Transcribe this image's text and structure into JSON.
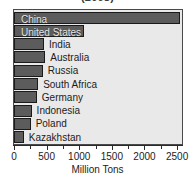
{
  "chart_data": {
    "type": "bar",
    "orientation": "horizontal",
    "title": "(2008)",
    "xlabel": "Million Tons",
    "ylabel": "",
    "xlim": [
      0,
      2575
    ],
    "grid": false,
    "legend": null,
    "bar_color": "#5c5c5c",
    "plot_background": "#e9e9e9",
    "categories": [
      "China",
      "United States",
      "India",
      "Australia",
      "Russia",
      "South Africa",
      "Germany",
      "Indonesia",
      "Poland",
      "Kazakhstan"
    ],
    "values": [
      2550,
      1070,
      460,
      480,
      440,
      370,
      350,
      270,
      255,
      150
    ],
    "label_placement": [
      "inside",
      "inside",
      "outside",
      "outside",
      "outside",
      "outside",
      "outside",
      "outside",
      "outside",
      "outside"
    ],
    "ticks": [
      {
        "value": 0,
        "label": "0"
      },
      {
        "value": 500,
        "label": "500"
      },
      {
        "value": 1000,
        "label": "1000"
      },
      {
        "value": 1500,
        "label": "1500"
      },
      {
        "value": 2000,
        "label": "2000"
      },
      {
        "value": 2500,
        "label": "2500"
      }
    ]
  }
}
